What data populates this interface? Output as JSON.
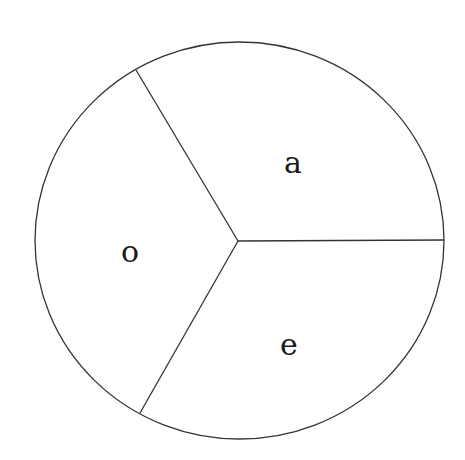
{
  "diagram": {
    "type": "divided-circle",
    "stroke_color": "#333333",
    "background": "#ffffff",
    "circle": {
      "cx": 239.5,
      "cy": 240.5,
      "rx": 204.5,
      "ry": 198.5
    },
    "center": {
      "x": 238,
      "y": 241
    },
    "dividers": [
      {
        "name": "divider-upper-left",
        "x2": 136,
        "y2": 70
      },
      {
        "name": "divider-right",
        "x2": 444,
        "y2": 240
      },
      {
        "name": "divider-lower-left",
        "x2": 140,
        "y2": 413
      }
    ],
    "sectors": [
      {
        "label": "a",
        "x": 293,
        "y": 173
      },
      {
        "label": "o",
        "x": 130,
        "y": 262
      },
      {
        "label": "e",
        "x": 289,
        "y": 355
      }
    ]
  }
}
